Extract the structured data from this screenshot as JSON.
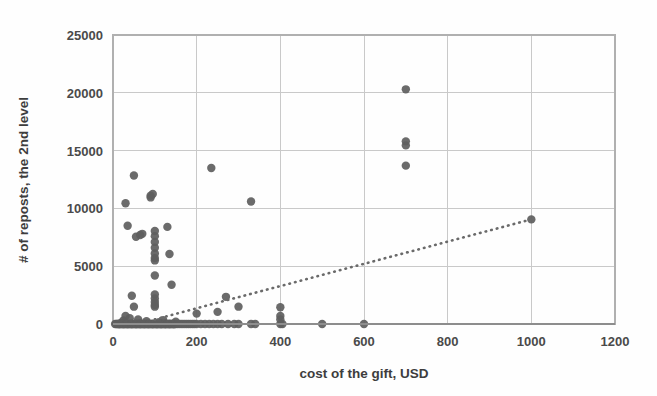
{
  "chart_data": {
    "type": "scatter",
    "title": "",
    "xlabel": "cost of the gift, USD",
    "ylabel": "# of reposts, the 2nd level",
    "xlim": [
      0,
      1200
    ],
    "ylim": [
      0,
      25000
    ],
    "xticks": [
      0,
      200,
      400,
      600,
      800,
      1000,
      1200
    ],
    "yticks": [
      0,
      5000,
      10000,
      15000,
      20000,
      25000
    ],
    "xtick_labels": [
      "0",
      "200",
      "400",
      "600",
      "800",
      "1000",
      "1200"
    ],
    "ytick_labels": [
      "0",
      "5000",
      "10000",
      "15000",
      "20000",
      "25000"
    ],
    "grid": true,
    "legend": false,
    "marker_color": "#5e5e5e",
    "trendline_color": "#6a6a6a",
    "series": [
      {
        "name": "gifts",
        "points": [
          [
            5,
            0
          ],
          [
            8,
            0
          ],
          [
            10,
            0
          ],
          [
            12,
            0
          ],
          [
            14,
            0
          ],
          [
            15,
            0
          ],
          [
            16,
            0
          ],
          [
            18,
            0
          ],
          [
            20,
            0
          ],
          [
            20,
            120
          ],
          [
            22,
            0
          ],
          [
            24,
            0
          ],
          [
            25,
            0
          ],
          [
            25,
            300
          ],
          [
            26,
            0
          ],
          [
            28,
            0
          ],
          [
            30,
            0
          ],
          [
            30,
            10450
          ],
          [
            30,
            700
          ],
          [
            32,
            0
          ],
          [
            34,
            0
          ],
          [
            35,
            0
          ],
          [
            35,
            8500
          ],
          [
            36,
            0
          ],
          [
            38,
            0
          ],
          [
            40,
            0
          ],
          [
            40,
            500
          ],
          [
            42,
            0
          ],
          [
            44,
            0
          ],
          [
            45,
            0
          ],
          [
            45,
            2450
          ],
          [
            46,
            0
          ],
          [
            48,
            0
          ],
          [
            50,
            0
          ],
          [
            50,
            12850
          ],
          [
            50,
            1500
          ],
          [
            52,
            0
          ],
          [
            54,
            0
          ],
          [
            55,
            0
          ],
          [
            55,
            7550
          ],
          [
            56,
            0
          ],
          [
            58,
            0
          ],
          [
            60,
            0
          ],
          [
            60,
            400
          ],
          [
            62,
            0
          ],
          [
            64,
            0
          ],
          [
            65,
            0
          ],
          [
            65,
            7700
          ],
          [
            66,
            0
          ],
          [
            68,
            0
          ],
          [
            70,
            0
          ],
          [
            70,
            7800
          ],
          [
            72,
            0
          ],
          [
            74,
            0
          ],
          [
            75,
            0
          ],
          [
            76,
            0
          ],
          [
            78,
            0
          ],
          [
            80,
            0
          ],
          [
            80,
            250
          ],
          [
            82,
            0
          ],
          [
            84,
            0
          ],
          [
            85,
            0
          ],
          [
            86,
            0
          ],
          [
            88,
            0
          ],
          [
            90,
            0
          ],
          [
            90,
            10950
          ],
          [
            90,
            11100
          ],
          [
            92,
            0
          ],
          [
            94,
            0
          ],
          [
            95,
            0
          ],
          [
            95,
            11250
          ],
          [
            96,
            0
          ],
          [
            98,
            0
          ],
          [
            100,
            0
          ],
          [
            100,
            8050
          ],
          [
            100,
            7600
          ],
          [
            100,
            7100
          ],
          [
            100,
            6600
          ],
          [
            100,
            6100
          ],
          [
            100,
            5700
          ],
          [
            100,
            5500
          ],
          [
            100,
            4200
          ],
          [
            100,
            2550
          ],
          [
            100,
            2200
          ],
          [
            100,
            1900
          ],
          [
            100,
            1650
          ],
          [
            100,
            1500
          ],
          [
            102,
            0
          ],
          [
            104,
            0
          ],
          [
            105,
            0
          ],
          [
            106,
            0
          ],
          [
            108,
            0
          ],
          [
            110,
            0
          ],
          [
            110,
            150
          ],
          [
            112,
            0
          ],
          [
            114,
            0
          ],
          [
            115,
            0
          ],
          [
            116,
            0
          ],
          [
            118,
            0
          ],
          [
            120,
            0
          ],
          [
            120,
            320
          ],
          [
            122,
            0
          ],
          [
            124,
            0
          ],
          [
            125,
            0
          ],
          [
            126,
            0
          ],
          [
            128,
            0
          ],
          [
            130,
            0
          ],
          [
            130,
            8400
          ],
          [
            132,
            0
          ],
          [
            134,
            0
          ],
          [
            135,
            0
          ],
          [
            135,
            6050
          ],
          [
            136,
            0
          ],
          [
            138,
            0
          ],
          [
            140,
            0
          ],
          [
            140,
            3400
          ],
          [
            142,
            0
          ],
          [
            144,
            0
          ],
          [
            145,
            0
          ],
          [
            146,
            0
          ],
          [
            148,
            0
          ],
          [
            150,
            0
          ],
          [
            150,
            200
          ],
          [
            155,
            0
          ],
          [
            160,
            0
          ],
          [
            165,
            0
          ],
          [
            170,
            0
          ],
          [
            175,
            0
          ],
          [
            180,
            0
          ],
          [
            185,
            0
          ],
          [
            190,
            0
          ],
          [
            195,
            0
          ],
          [
            200,
            0
          ],
          [
            200,
            900
          ],
          [
            210,
            0
          ],
          [
            220,
            0
          ],
          [
            230,
            0
          ],
          [
            235,
            13500
          ],
          [
            240,
            0
          ],
          [
            250,
            0
          ],
          [
            250,
            1050
          ],
          [
            260,
            0
          ],
          [
            270,
            2350
          ],
          [
            275,
            0
          ],
          [
            290,
            0
          ],
          [
            300,
            0
          ],
          [
            300,
            1500
          ],
          [
            330,
            0
          ],
          [
            330,
            10600
          ],
          [
            340,
            0
          ],
          [
            400,
            0
          ],
          [
            400,
            1450
          ],
          [
            400,
            700
          ],
          [
            400,
            400
          ],
          [
            405,
            0
          ],
          [
            500,
            0
          ],
          [
            600,
            0
          ],
          [
            700,
            20300
          ],
          [
            700,
            15800
          ],
          [
            700,
            15450
          ],
          [
            700,
            13700
          ],
          [
            1000,
            9050
          ]
        ]
      }
    ],
    "trendline": {
      "type": "linear-dotted",
      "start": [
        100,
        400
      ],
      "end": [
        1000,
        9050
      ]
    }
  },
  "axes": {
    "x_axis_name": "x-axis",
    "y_axis_name": "y-axis"
  }
}
